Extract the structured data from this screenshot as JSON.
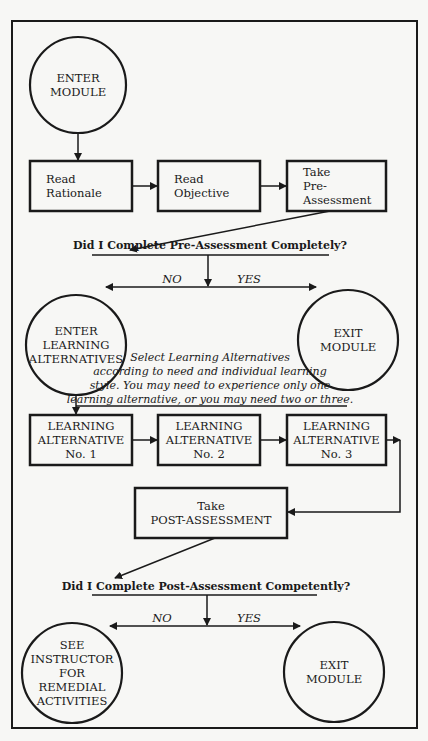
{
  "diagram": {
    "colors": {
      "ink": "#1a1a1a",
      "paper": "#f7f7f5"
    },
    "frame": {
      "x": 12,
      "y": 21,
      "w": 405,
      "h": 707
    },
    "nodes": [
      {
        "id": "enter-module",
        "shape": "circle",
        "cx": 78,
        "cy": 85,
        "r": 48,
        "lines": [
          "ENTER",
          "MODULE"
        ]
      },
      {
        "id": "read-rationale",
        "shape": "rect",
        "x": 30,
        "y": 161,
        "w": 102,
        "h": 50,
        "align": "left",
        "lines": [
          "Read",
          "Rationale"
        ]
      },
      {
        "id": "read-objective",
        "shape": "rect",
        "x": 158,
        "y": 161,
        "w": 102,
        "h": 50,
        "align": "left",
        "lines": [
          "Read",
          "Objective"
        ]
      },
      {
        "id": "take-pre-assessment",
        "shape": "rect",
        "x": 287,
        "y": 161,
        "w": 99,
        "h": 50,
        "align": "left",
        "lines": [
          "Take",
          "Pre-",
          "Assessment"
        ]
      },
      {
        "id": "enter-learning-alternatives",
        "shape": "circle",
        "cx": 76,
        "cy": 345,
        "r": 50,
        "lines": [
          "ENTER",
          "LEARNING",
          "ALTERNATIVES"
        ]
      },
      {
        "id": "exit-module-1",
        "shape": "circle",
        "cx": 348,
        "cy": 340,
        "r": 50,
        "lines": [
          "EXIT",
          "MODULE"
        ]
      },
      {
        "id": "learning-alternative-1",
        "shape": "rect",
        "x": 30,
        "y": 415,
        "w": 102,
        "h": 50,
        "align": "center",
        "lines": [
          "LEARNING",
          "ALTERNATIVE",
          "No. 1"
        ]
      },
      {
        "id": "learning-alternative-2",
        "shape": "rect",
        "x": 158,
        "y": 415,
        "w": 102,
        "h": 50,
        "align": "center",
        "lines": [
          "LEARNING",
          "ALTERNATIVE",
          "No. 2"
        ]
      },
      {
        "id": "learning-alternative-3",
        "shape": "rect",
        "x": 287,
        "y": 415,
        "w": 99,
        "h": 50,
        "align": "center",
        "lines": [
          "LEARNING",
          "ALTERNATIVE",
          "No. 3"
        ]
      },
      {
        "id": "take-post-assessment",
        "shape": "rect",
        "x": 135,
        "y": 488,
        "w": 152,
        "h": 50,
        "align": "center",
        "lines": [
          "Take",
          "POST-ASSESSMENT"
        ]
      },
      {
        "id": "see-instructor",
        "shape": "circle",
        "cx": 72,
        "cy": 673,
        "r": 50,
        "lines": [
          "SEE",
          "INSTRUCTOR",
          "FOR",
          "REMEDIAL",
          "ACTIVITIES"
        ]
      },
      {
        "id": "exit-module-2",
        "shape": "circle",
        "cx": 334,
        "cy": 672,
        "r": 50,
        "lines": [
          "EXIT",
          "MODULE"
        ]
      }
    ],
    "questions": [
      {
        "id": "pre-question",
        "text": "Did I Complete Pre-Assessment Completely?",
        "x": 210,
        "y": 249,
        "underline": [
          92,
          329,
          255
        ]
      },
      {
        "id": "post-question",
        "text": "Did I Complete Post-Assessment Competently?",
        "x": 206,
        "y": 590,
        "underline": [
          92,
          317,
          595
        ]
      }
    ],
    "branches": [
      {
        "id": "pre-no",
        "text": "NO",
        "x": 172,
        "y": 283
      },
      {
        "id": "pre-yes",
        "text": "YES",
        "x": 249,
        "y": 283
      },
      {
        "id": "post-no",
        "text": "NO",
        "x": 162,
        "y": 622
      },
      {
        "id": "post-yes",
        "text": "YES",
        "x": 249,
        "y": 622
      }
    ],
    "note": {
      "lines": [
        "Select Learning Alternatives",
        "according to need and individual learning",
        "style.  You may need to experience only one",
        "learning alternative, or you may need two or three."
      ],
      "x": 210,
      "y": 361,
      "line_height": 14,
      "underline": [
        76,
        347,
        406
      ]
    },
    "edges": [
      {
        "points": [
          [
            78,
            133
          ],
          [
            78,
            160
          ]
        ],
        "arrow": true
      },
      {
        "points": [
          [
            132,
            186
          ],
          [
            157,
            186
          ]
        ],
        "arrow": true
      },
      {
        "points": [
          [
            260,
            186
          ],
          [
            286,
            186
          ]
        ],
        "arrow": true
      },
      {
        "points": [
          [
            330,
            211
          ],
          [
            130,
            250
          ]
        ],
        "arrow": true
      },
      {
        "points": [
          [
            208,
            255
          ],
          [
            208,
            286
          ]
        ],
        "arrow": true
      },
      {
        "points": [
          [
            208,
            287
          ],
          [
            106,
            287
          ]
        ],
        "arrow": true
      },
      {
        "points": [
          [
            208,
            287
          ],
          [
            316,
            287
          ]
        ],
        "arrow": true
      },
      {
        "points": [
          [
            76,
            395
          ],
          [
            76,
            414
          ]
        ],
        "arrow": true
      },
      {
        "points": [
          [
            132,
            440
          ],
          [
            157,
            440
          ]
        ],
        "arrow": true
      },
      {
        "points": [
          [
            260,
            440
          ],
          [
            286,
            440
          ]
        ],
        "arrow": true
      },
      {
        "points": [
          [
            386,
            440
          ],
          [
            400,
            440
          ]
        ],
        "arrow": true
      },
      {
        "points": [
          [
            400,
            440
          ],
          [
            400,
            512
          ],
          [
            288,
            512
          ]
        ],
        "arrow": true
      },
      {
        "points": [
          [
            215,
            538
          ],
          [
            115,
            578
          ]
        ],
        "arrow": true
      },
      {
        "points": [
          [
            207,
            595
          ],
          [
            207,
            625
          ]
        ],
        "arrow": true
      },
      {
        "points": [
          [
            207,
            626
          ],
          [
            110,
            626
          ]
        ],
        "arrow": true
      },
      {
        "points": [
          [
            207,
            626
          ],
          [
            300,
            626
          ]
        ],
        "arrow": true
      }
    ]
  }
}
